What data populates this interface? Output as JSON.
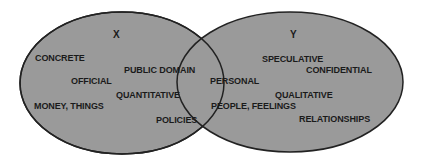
{
  "diagram": {
    "type": "venn",
    "colors": {
      "fill": "#9a9a9a",
      "stroke": "#222222",
      "text": "#1a1a1a",
      "background": "#ffffff"
    },
    "sets": [
      {
        "name": "X",
        "items": [
          "CONCRETE",
          "OFFICIAL",
          "MONEY, THINGS",
          "PUBLIC DOMAIN",
          "QUANTITATIVE",
          "POLICIES"
        ]
      },
      {
        "name": "Y",
        "items": [
          "SPECULATIVE",
          "CONFIDENTIAL",
          "PERSONAL",
          "QUALITATIVE",
          "PEOPLE, FEELINGS",
          "RELATIONSHIPS"
        ]
      }
    ]
  }
}
